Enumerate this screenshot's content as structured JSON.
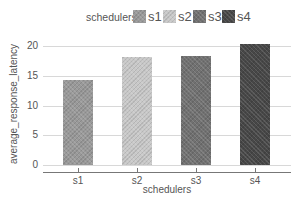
{
  "chart_data": {
    "type": "bar",
    "title": "",
    "xlabel": "schedulers",
    "ylabel": "average_response_latency",
    "categories": [
      "s1",
      "s2",
      "s3",
      "s4"
    ],
    "values": [
      14.3,
      18.2,
      18.4,
      20.4
    ],
    "colors": [
      "#999999",
      "#c8c8c8",
      "#717171",
      "#474747"
    ],
    "ylim": [
      0,
      21
    ],
    "yticks": [
      0,
      5,
      10,
      15,
      20
    ],
    "grid": true,
    "legend": {
      "title": "schedulers",
      "position": "top",
      "entries": [
        "s1",
        "s2",
        "s3",
        "s4"
      ]
    }
  }
}
